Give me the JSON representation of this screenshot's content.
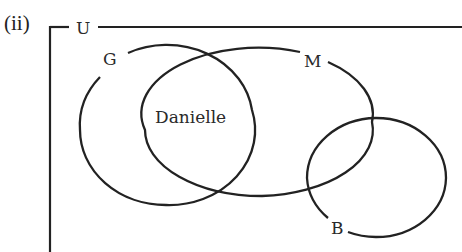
{
  "question": {
    "part_label": "(ii)"
  },
  "venn": {
    "universal_set": {
      "label": "U"
    },
    "sets": [
      {
        "id": "G",
        "label": "G"
      },
      {
        "id": "M",
        "label": "M"
      },
      {
        "id": "B",
        "label": "B"
      }
    ],
    "elements": [
      {
        "text": "Danielle",
        "region": "G ∩ M only"
      }
    ],
    "colors": {
      "stroke": "#222222",
      "text": "#2a2a2a",
      "background": "#ffffff"
    }
  }
}
